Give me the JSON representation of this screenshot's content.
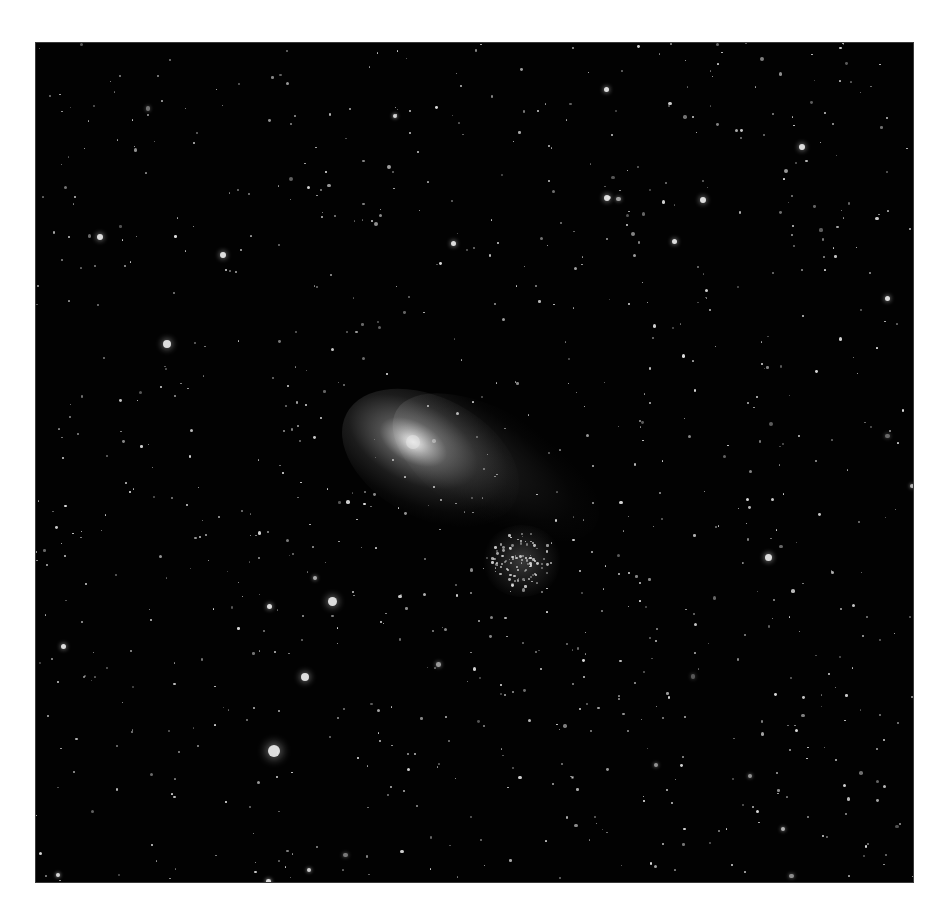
{
  "image": {
    "subject": "Comet and star cluster in a dense starfield",
    "frame": {
      "left": 36,
      "top": 43,
      "width": 877,
      "height": 839,
      "background": "#020202",
      "page_background": "#ffffff"
    },
    "comet": {
      "nucleus": {
        "x": 377,
        "y": 399
      },
      "tail_direction": "lower-right"
    },
    "cluster": {
      "center": {
        "x": 486,
        "y": 517
      },
      "radius": 30
    }
  },
  "bright_stars": [
    {
      "x": 238,
      "y": 708,
      "r": 6
    },
    {
      "x": 296,
      "y": 558,
      "r": 4.5
    },
    {
      "x": 269,
      "y": 634,
      "r": 4
    },
    {
      "x": 131,
      "y": 301,
      "r": 4
    },
    {
      "x": 732,
      "y": 514,
      "r": 3.5
    },
    {
      "x": 64,
      "y": 194,
      "r": 3
    },
    {
      "x": 187,
      "y": 212,
      "r": 3
    },
    {
      "x": 571,
      "y": 155,
      "r": 3
    },
    {
      "x": 667,
      "y": 157,
      "r": 3
    },
    {
      "x": 766,
      "y": 104,
      "r": 3
    },
    {
      "x": 638,
      "y": 198,
      "r": 2.5
    },
    {
      "x": 851,
      "y": 255,
      "r": 2.5
    },
    {
      "x": 417,
      "y": 200,
      "r": 2.5
    },
    {
      "x": 570,
      "y": 46,
      "r": 2.5
    },
    {
      "x": 27,
      "y": 603,
      "r": 2.5
    },
    {
      "x": 233,
      "y": 563,
      "r": 2.5
    }
  ],
  "starfield": {
    "count": 900,
    "seed": 7,
    "cluster_count": 90
  }
}
